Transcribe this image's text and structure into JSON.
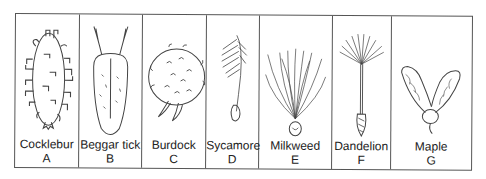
{
  "panels": [
    {
      "name": "Cocklebur",
      "letter": "A",
      "width": 64
    },
    {
      "name": "Beggar tick",
      "letter": "B",
      "width": 63
    },
    {
      "name": "Burdock",
      "letter": "C",
      "width": 64
    },
    {
      "name": "Sycamore",
      "letter": "D",
      "width": 53
    },
    {
      "name": "Milkweed",
      "letter": "E",
      "width": 73
    },
    {
      "name": "Dandelion",
      "letter": "F",
      "width": 59
    },
    {
      "name": "Maple",
      "letter": "G",
      "width": 82
    }
  ],
  "colors": {
    "line": "#444444",
    "border": "#555555",
    "text": "#222222"
  }
}
